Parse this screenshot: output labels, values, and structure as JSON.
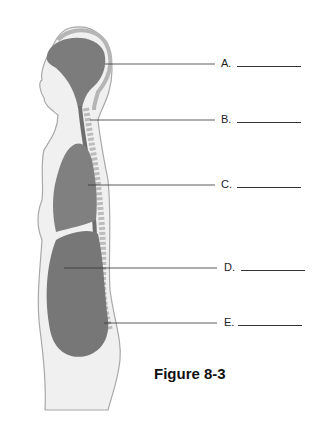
{
  "figure": {
    "caption": "Figure 8-3",
    "labels": [
      {
        "letter": "A.",
        "y": 64
      },
      {
        "letter": "B.",
        "y": 120
      },
      {
        "letter": "C.",
        "y": 185
      },
      {
        "letter": "D.",
        "y": 268
      },
      {
        "letter": "E.",
        "y": 323
      }
    ],
    "colors": {
      "organ": "#7a7a7a",
      "skin": "#efefef",
      "outline": "#9a9a9a",
      "bone": "#c9c9c9"
    }
  }
}
